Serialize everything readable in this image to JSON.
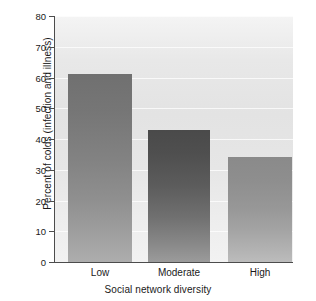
{
  "chart_data": {
    "type": "bar",
    "title": "",
    "categories": [
      "Low",
      "Moderate",
      "High"
    ],
    "values": [
      61,
      43,
      34
    ],
    "xlabel": "Social network diversity",
    "ylabel": "Percent of colds (infection and illness)",
    "ylim": [
      0,
      80
    ],
    "yticks": [
      0,
      10,
      20,
      30,
      40,
      50,
      60,
      70,
      80
    ],
    "ytick_labels": [
      "0",
      "10",
      "20",
      "30",
      "40",
      "50",
      "60",
      "70",
      "80"
    ],
    "grid": true,
    "grid_orientation": "horizontal",
    "grid_color": "#ffffff",
    "legend": null,
    "legend_position": "none",
    "background_color": "#e8e8e8",
    "figure_background": "#ffffff",
    "axis_color": "#4c4c4c",
    "bar_colors": [
      "#828282",
      "#5c5c5c",
      "#979797"
    ],
    "series": [
      {
        "name": "Percent of colds (infection and illness)",
        "values": [
          61,
          43,
          34
        ]
      }
    ]
  }
}
